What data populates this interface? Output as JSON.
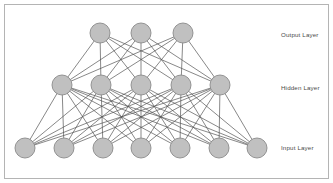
{
  "diagram": {
    "type": "feedforward-neural-network",
    "background_color": "#ffffff",
    "frame_color": "#b4b4b4",
    "node_fill_color": "#c0c0c0",
    "node_stroke_color": "#8a8a8a",
    "edge_color": "#555555",
    "label_color": "#4a4a4a",
    "layers": [
      {
        "id": "output",
        "label": "Output Layer",
        "node_count": 3,
        "node_y": 33,
        "node_radius": 10,
        "node_x": [
          100,
          141,
          183
        ],
        "label_x": 281,
        "label_y": 35
      },
      {
        "id": "hidden",
        "label": "Hidden Layer",
        "node_count": 5,
        "node_y": 85,
        "node_radius": 10,
        "node_x": [
          62,
          101,
          141,
          181,
          220
        ],
        "label_x": 281,
        "label_y": 88
      },
      {
        "id": "input",
        "label": "Input Layer",
        "node_count": 7,
        "node_y": 148,
        "node_radius": 10,
        "node_x": [
          25,
          64,
          103,
          141,
          180,
          219,
          257
        ],
        "label_x": 281,
        "label_y": 148
      }
    ],
    "connections": [
      {
        "from": "input",
        "to": "hidden",
        "fully_connected": true
      },
      {
        "from": "hidden",
        "to": "output",
        "fully_connected": true
      }
    ]
  }
}
